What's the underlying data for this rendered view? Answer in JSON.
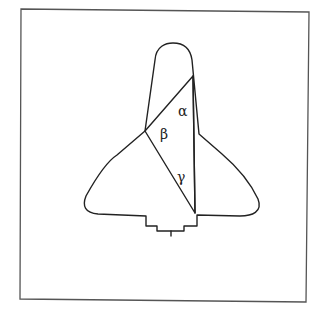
{
  "diagram": {
    "angles": [
      {
        "id": "alpha",
        "symbol": "α"
      },
      {
        "id": "beta",
        "symbol": "β"
      },
      {
        "id": "gamma",
        "symbol": "γ"
      }
    ],
    "colors": {
      "line": "#222222",
      "frame": "#555555",
      "background": "#ffffff"
    }
  }
}
